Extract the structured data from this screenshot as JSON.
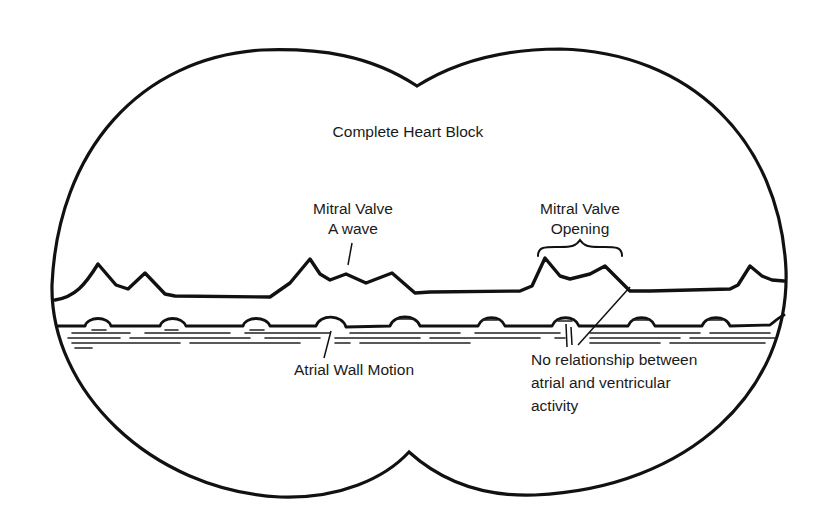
{
  "figure": {
    "title": "Complete Heart Block",
    "labels": {
      "a_wave_line1": "Mitral Valve",
      "a_wave_line2": "A wave",
      "opening_line1": "Mitral Valve",
      "opening_line2": "Opening",
      "atrial_wall": "Atrial Wall Motion",
      "no_relation_line1": "No relationship between",
      "no_relation_line2": "atrial and ventricular",
      "no_relation_line3": "activity"
    },
    "colors": {
      "ink": "#111111",
      "background": "#ffffff"
    }
  }
}
